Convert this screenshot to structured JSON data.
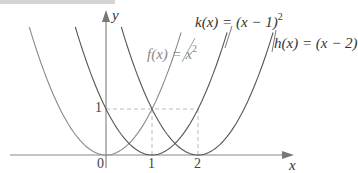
{
  "figure": {
    "axes": {
      "x_label": "x",
      "y_label": "y",
      "x_ticks": [
        "0",
        "1",
        "2"
      ],
      "y_ticks": [
        "1"
      ]
    },
    "curves": [
      {
        "name": "f",
        "label_prefix": "f(x) = x",
        "exponent": "2",
        "color": "#8a8a8a",
        "shift": 0
      },
      {
        "name": "k",
        "label_prefix": "k(x) = (x − 1)",
        "exponent": "2",
        "color": "#555555",
        "shift": 1
      },
      {
        "name": "h",
        "label_prefix": "h(x) = (x − 2)",
        "exponent": "",
        "color": "#555555",
        "shift": 2
      }
    ],
    "guides": {
      "style": "dashed",
      "y_level": 1,
      "x_points": [
        1,
        2
      ]
    }
  }
}
